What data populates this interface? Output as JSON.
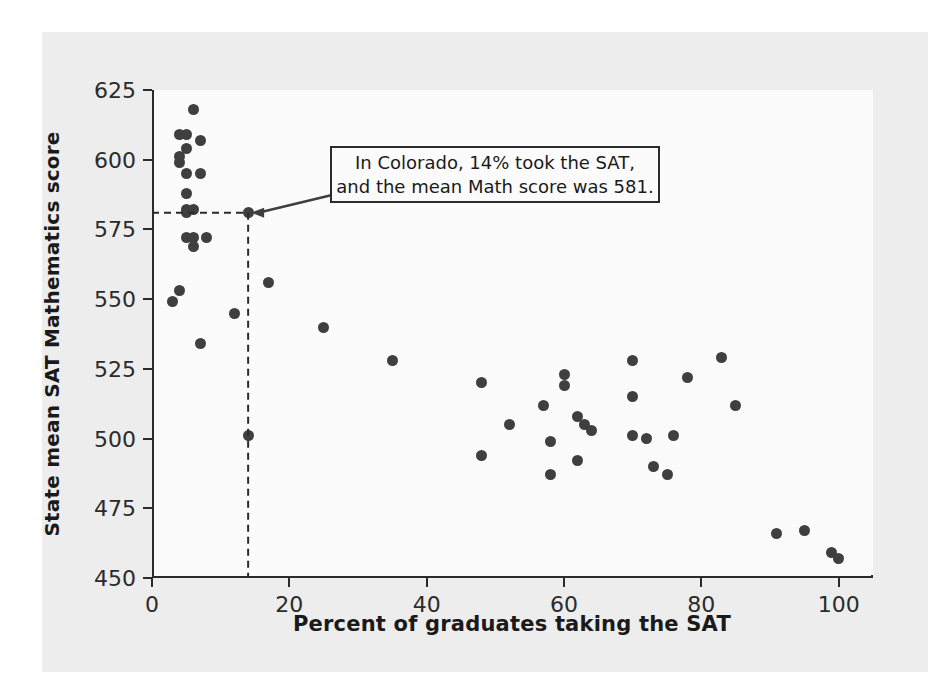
{
  "figure": {
    "background_color": "#ededed",
    "plot_background_color": "#fbfbfb",
    "axis_color": "#2b2b2b",
    "marker_color": "#3f3f3f"
  },
  "annotation": {
    "line1": "In Colorado, 14% took the SAT,",
    "line2": "and the mean Math score was 581.",
    "target_x": 14,
    "target_y": 581
  },
  "chart_data": {
    "type": "scatter",
    "title": "",
    "xlabel": "Percent of graduates taking the SAT",
    "ylabel": "State mean SAT Mathematics score",
    "xlim": [
      0,
      105
    ],
    "ylim": [
      450,
      625
    ],
    "xticks": [
      0,
      20,
      40,
      60,
      80,
      100
    ],
    "yticks": [
      450,
      475,
      500,
      525,
      550,
      575,
      600,
      625
    ],
    "xtick_labels": [
      "0",
      "20",
      "40",
      "60",
      "80",
      "100"
    ],
    "ytick_labels": [
      "450",
      "475",
      "500",
      "525",
      "550",
      "575",
      "600",
      "625"
    ],
    "grid": false,
    "legend": null,
    "points": [
      [
        6,
        618
      ],
      [
        4,
        609
      ],
      [
        5,
        609
      ],
      [
        7,
        607
      ],
      [
        5,
        604
      ],
      [
        4,
        601
      ],
      [
        4,
        599
      ],
      [
        5,
        595
      ],
      [
        7,
        595
      ],
      [
        5,
        588
      ],
      [
        5,
        582
      ],
      [
        5,
        581
      ],
      [
        6,
        582
      ],
      [
        14,
        581
      ],
      [
        5,
        572
      ],
      [
        6,
        572
      ],
      [
        6,
        569
      ],
      [
        8,
        572
      ],
      [
        17,
        556
      ],
      [
        4,
        553
      ],
      [
        3,
        549
      ],
      [
        12,
        545
      ],
      [
        25,
        540
      ],
      [
        7,
        534
      ],
      [
        35,
        528
      ],
      [
        83,
        529
      ],
      [
        70,
        528
      ],
      [
        85,
        512
      ],
      [
        60,
        523
      ],
      [
        78,
        522
      ],
      [
        48,
        520
      ],
      [
        70,
        515
      ],
      [
        57,
        512
      ],
      [
        60,
        519
      ],
      [
        52,
        505
      ],
      [
        63,
        505
      ],
      [
        64,
        503
      ],
      [
        62,
        508
      ],
      [
        70,
        501
      ],
      [
        72,
        500
      ],
      [
        76,
        501
      ],
      [
        14,
        501
      ],
      [
        58,
        499
      ],
      [
        48,
        494
      ],
      [
        73,
        490
      ],
      [
        62,
        492
      ],
      [
        58,
        487
      ],
      [
        75,
        487
      ],
      [
        91,
        466
      ],
      [
        95,
        467
      ],
      [
        99,
        459
      ],
      [
        100,
        457
      ]
    ]
  }
}
